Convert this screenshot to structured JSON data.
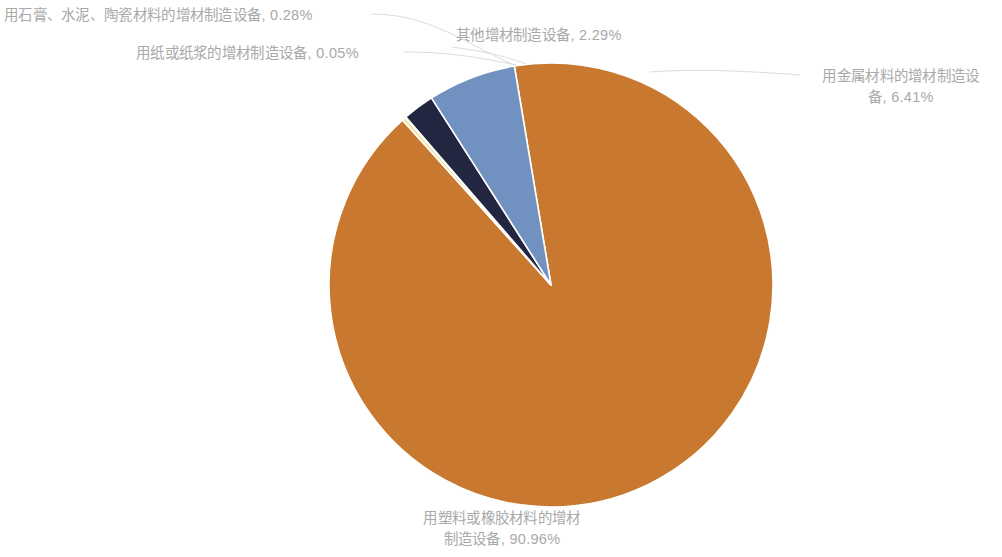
{
  "chart_data": {
    "type": "pie",
    "title": "",
    "subtitle": "",
    "xlabel": "",
    "ylabel": "",
    "grid": false,
    "legend_position": "none",
    "label_format": "name, value%",
    "start_angle_deg": -9.5,
    "direction": "clockwise",
    "categories": [
      "用塑料或橡胶材料的增材制造设备",
      "用石膏、水泥、陶瓷材料的增材制造设备",
      "用纸或纸浆的增材制造设备",
      "其他增材制造设备",
      "用金属材料的增材制造设备"
    ],
    "values": [
      90.96,
      0.28,
      0.05,
      2.29,
      6.41
    ],
    "unit": "%",
    "colors": [
      "#c8792f",
      "#f2e6a0",
      "#fdfbe8",
      "#232640",
      "#7191c0"
    ],
    "slice_border_color": "#ffffff",
    "slices": [
      {
        "name": "用塑料或橡胶材料的增材制造设备",
        "value": 90.96,
        "color": "#c8792f"
      },
      {
        "name": "用石膏、水泥、陶瓷材料的增材制造设备",
        "value": 0.28,
        "color": "#f2e6a0"
      },
      {
        "name": "用纸或纸浆的增材制造设备",
        "value": 0.05,
        "color": "#fdfbe8"
      },
      {
        "name": "其他增材制造设备",
        "value": 2.29,
        "color": "#232640"
      },
      {
        "name": "用金属材料的增材制造设备",
        "value": 6.41,
        "color": "#7191c0"
      }
    ]
  },
  "labels": {
    "gypsum": "用石膏、水泥、陶瓷材料的增材制造设备, 0.28%",
    "paper": "用纸或纸浆的增材制造设备, 0.05%",
    "other": "其他增材制造设备, 2.29%",
    "metal_line1": "用金属材料的增材制造设",
    "metal_line2": "备, 6.41%",
    "plastic_line1": "用塑料或橡胶材料的增材",
    "plastic_line2": "制造设备, 90.96%"
  },
  "style": {
    "label_color": "#a9a9a9",
    "leader_line_color": "#dcdcdc",
    "background": "#ffffff"
  }
}
